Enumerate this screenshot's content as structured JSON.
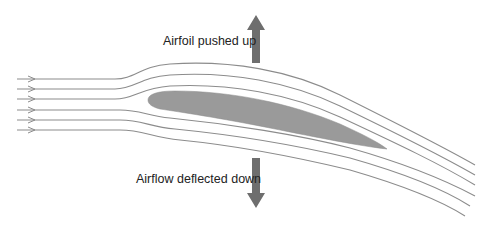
{
  "diagram": {
    "labels": {
      "lift": "Airfoil pushed up",
      "downwash": "Airflow deflected down"
    },
    "elements": {
      "streamline_count": 6,
      "airfoil": "airfoil-shape",
      "arrows": [
        "lift-arrow-up",
        "downwash-arrow-down"
      ]
    },
    "colors": {
      "streamline": "#8c8c8c",
      "airfoil": "#9a9a9a",
      "force_arrow": "#6e6e6e",
      "text": "#222222",
      "background": "#ffffff"
    }
  }
}
